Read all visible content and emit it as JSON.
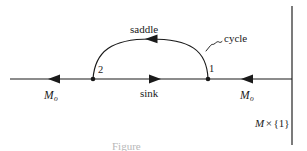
{
  "figure": {
    "background_color": "#ffffff",
    "ink_color": "#1a1a1a",
    "labels": {
      "saddle": "saddle",
      "cycle": "cycle",
      "node_left": "2",
      "node_right": "1",
      "sink": "sink",
      "manifold_left": "M",
      "manifold_left_subscript": "o",
      "manifold_right": "M",
      "manifold_right_subscript": "o",
      "product_space_m": "M",
      "product_space_times": "×",
      "product_space_fiber": "{1}"
    },
    "caption": "Figure",
    "geometry": {
      "axis_y": 79,
      "axis_x_start": 10,
      "axis_x_end": 292,
      "node_left_x": 93,
      "node_right_x": 208,
      "vertical_line_x": 292,
      "arc_apex_y": 39
    },
    "flow_directions": {
      "left_segment": "leftward",
      "middle_segment": "rightward",
      "right_segment": "leftward",
      "arc": "leftward"
    }
  }
}
